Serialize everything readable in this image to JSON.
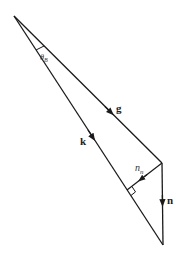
{
  "diagram": {
    "type": "vector-triangle",
    "stroke_color": "#1a1a1a",
    "background": "#ffffff",
    "vertices": {
      "apex": [
        14,
        16
      ],
      "right": [
        162,
        163
      ],
      "bottom": [
        163,
        245
      ],
      "foot": [
        127,
        190
      ]
    },
    "vectors": [
      {
        "id": "g",
        "label": "g",
        "from": "apex",
        "to": "right",
        "style": "bold"
      },
      {
        "id": "n",
        "label": "n",
        "from": "right",
        "to": "bottom",
        "style": "bold"
      },
      {
        "id": "k",
        "label": "k",
        "from": "apex",
        "to": "bottom",
        "style": "bold"
      },
      {
        "id": "n_n",
        "label": "n",
        "subscript": "n",
        "from": "right",
        "to": "foot",
        "style": "italic"
      }
    ],
    "angle_label": {
      "symbol": "θ",
      "subscript": "B"
    },
    "right_angle_marker": true
  }
}
